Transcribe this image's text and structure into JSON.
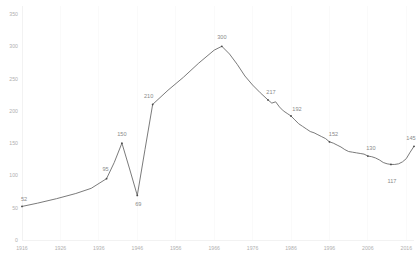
{
  "chart_data": {
    "type": "line",
    "title": "",
    "subtitle": "",
    "xlabel": "",
    "ylabel": "",
    "xlim": [
      1916,
      2018
    ],
    "ylim": [
      0,
      350
    ],
    "grid": "vertical-only",
    "legend": "none",
    "y_ticks": [
      0,
      50,
      100,
      150,
      200,
      250,
      300,
      350
    ],
    "x_ticks": [
      1916,
      1926,
      1936,
      1946,
      1956,
      1966,
      1976,
      1986,
      1996,
      2006,
      2016
    ],
    "line_color": "#6b6b6b",
    "label_color": "#8a8a8a",
    "tick_color": "#b0b0b0",
    "grid_color": "#fafafa",
    "series": [
      {
        "name": "series-1",
        "x": [
          1916,
          1920,
          1925,
          1930,
          1934,
          1938,
          1940,
          1942,
          1944,
          1946,
          1948,
          1950,
          1954,
          1958,
          1962,
          1966,
          1968,
          1970,
          1972,
          1974,
          1976,
          1978,
          1980,
          1981,
          1982,
          1983,
          1984,
          1985,
          1986,
          1987,
          1988,
          1989,
          1990,
          1991,
          1992,
          1993,
          1994,
          1995,
          1996,
          1997,
          1998,
          1999,
          2000,
          2001,
          2002,
          2003,
          2004,
          2005,
          2006,
          2007,
          2008,
          2009,
          2010,
          2011,
          2012,
          2013,
          2014,
          2015,
          2016,
          2017,
          2018
        ],
        "y": [
          52,
          57,
          64,
          72,
          80,
          95,
          120,
          150,
          110,
          69,
          140,
          210,
          232,
          252,
          274,
          294,
          300,
          288,
          272,
          254,
          240,
          228,
          217,
          212,
          214,
          206,
          200,
          196,
          192,
          186,
          180,
          176,
          172,
          168,
          166,
          163,
          160,
          157,
          152,
          150,
          147,
          144,
          140,
          137,
          136,
          135,
          134,
          133,
          130,
          129,
          127,
          124,
          120,
          118,
          117,
          117,
          118,
          121,
          126,
          136,
          145
        ]
      }
    ],
    "annotations": [
      {
        "label": "52",
        "x": 1916,
        "y": 52,
        "dx": 2,
        "dy": -5
      },
      {
        "label": "95",
        "x": 1938,
        "y": 95,
        "dx": -1,
        "dy": -8
      },
      {
        "label": "150",
        "x": 1942,
        "y": 150,
        "dx": 0,
        "dy": -7
      },
      {
        "label": "69",
        "x": 1946,
        "y": 69,
        "dx": 1,
        "dy": 11
      },
      {
        "label": "210",
        "x": 1950,
        "y": 210,
        "dx": -4,
        "dy": -6
      },
      {
        "label": "300",
        "x": 1968,
        "y": 300,
        "dx": 0,
        "dy": -7
      },
      {
        "label": "217",
        "x": 1980,
        "y": 217,
        "dx": 3,
        "dy": -6
      },
      {
        "label": "192",
        "x": 1986,
        "y": 192,
        "dx": 6,
        "dy": -5
      },
      {
        "label": "152",
        "x": 1996,
        "y": 152,
        "dx": 4,
        "dy": -6
      },
      {
        "label": "130",
        "x": 2006,
        "y": 130,
        "dx": 3,
        "dy": -6
      },
      {
        "label": "117",
        "x": 2012,
        "y": 117,
        "dx": 1,
        "dy": 19
      },
      {
        "label": "145",
        "x": 2018,
        "y": 145,
        "dx": -3,
        "dy": -6
      }
    ]
  }
}
